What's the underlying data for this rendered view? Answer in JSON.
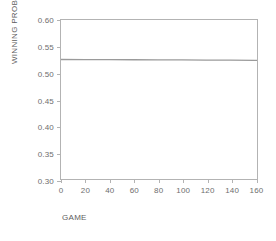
{
  "chart_data": {
    "type": "line",
    "title": "",
    "subtitle": "",
    "xlabel": "GAME",
    "ylabel": "WINNING PROBABILITY",
    "xlim": [
      0,
      162
    ],
    "ylim": [
      0.3,
      0.6
    ],
    "xticks": [
      0,
      20,
      40,
      60,
      80,
      100,
      120,
      140,
      160
    ],
    "xtick_labels": [
      "0",
      "20",
      "40",
      "60",
      "80",
      "100",
      "120",
      "140",
      "160"
    ],
    "yticks": [
      0.3,
      0.35,
      0.4,
      0.45,
      0.5,
      0.55,
      0.6
    ],
    "ytick_labels": [
      "0.30",
      "0.35",
      "0.40",
      "0.45",
      "0.50",
      "0.55",
      "0.60"
    ],
    "grid": false,
    "legend": false,
    "legend_position": "none",
    "series": [
      {
        "name": "winning probability",
        "color": "#9a9a9a",
        "x": [
          0,
          20,
          40,
          60,
          80,
          100,
          120,
          140,
          160,
          162
        ],
        "values": [
          0.5255,
          0.5253,
          0.5251,
          0.525,
          0.5248,
          0.5246,
          0.5244,
          0.5242,
          0.524,
          0.524
        ]
      }
    ]
  },
  "axes": {
    "frame_color": "#b3b3b3",
    "tick_color": "#b3b3b3",
    "tick_label_color": "#6e6e6e",
    "axis_title_color": "#5e5e5e"
  },
  "background": "#ffffff"
}
